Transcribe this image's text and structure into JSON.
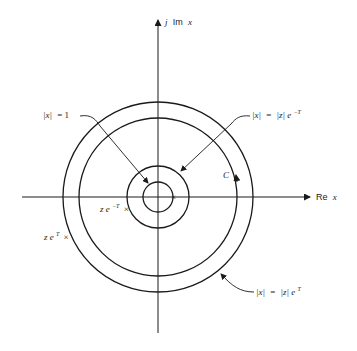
{
  "diagram": {
    "type": "complex-plane contour diagram",
    "axes": {
      "vertical_label_prefix": "j",
      "vertical_label_im": "Im",
      "vertical_label_var": "x",
      "horizontal_label_re": "Re",
      "horizontal_label_var": "x"
    },
    "circles": [
      {
        "name": "unit-circle",
        "label": "|x| = 1"
      },
      {
        "name": "inner-contour-circle",
        "label": "|x| = |z| e^{-T}"
      },
      {
        "name": "contour-C",
        "label": "C"
      },
      {
        "name": "outer-contour-circle",
        "label": "|x| = |z| e^{T}"
      }
    ],
    "labels": {
      "unit_circle_lhs": "|x|",
      "unit_circle_eq": "= 1",
      "inner_lhs": "|x|",
      "inner_eq": "=",
      "inner_rhs": "|z| e",
      "inner_exp": "−T",
      "outer_lhs": "|x|",
      "outer_eq": "=",
      "outer_rhs": "|z| e",
      "outer_exp": "T",
      "contour": "C",
      "pole_inner_base": "z e",
      "pole_inner_exp": "−T",
      "pole_outer_base": "z e",
      "pole_outer_exp": "T",
      "pole_marker": "×"
    },
    "colors": {
      "stroke": "#1a1a1a",
      "background": "#ffffff"
    }
  }
}
